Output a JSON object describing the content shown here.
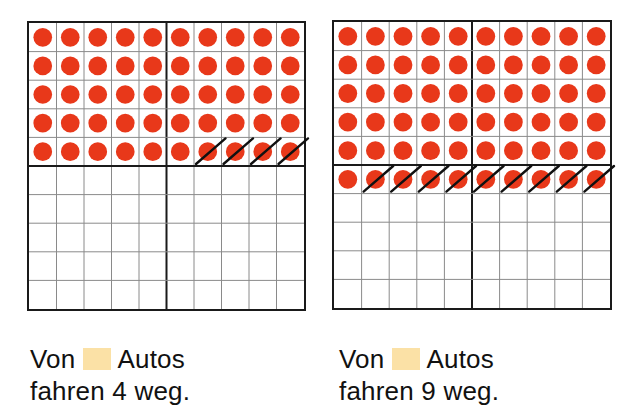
{
  "colors": {
    "dot": "#e8381a",
    "grid_line": "#8a8a8a",
    "grid_border": "#1a1a1a",
    "strike": "#111111",
    "blank_box": "#fbe1a6"
  },
  "exercises": [
    {
      "id": "left",
      "grid": {
        "rows": 10,
        "cols": 10,
        "filled_rows": 5,
        "total_dots": 50,
        "crossed_out": 4,
        "thick_divider_row": 5,
        "thick_divider_col": 5
      },
      "caption": {
        "line1_before": "Von",
        "line1_after": "Autos",
        "line2": "fahren 4 weg."
      }
    },
    {
      "id": "right",
      "grid": {
        "rows": 10,
        "cols": 10,
        "filled_rows": 6,
        "total_dots": 60,
        "crossed_out": 9,
        "thick_divider_row": 5,
        "thick_divider_col": 5
      },
      "caption": {
        "line1_before": "Von",
        "line1_after": "Autos",
        "line2": "fahren 9 weg."
      }
    }
  ]
}
